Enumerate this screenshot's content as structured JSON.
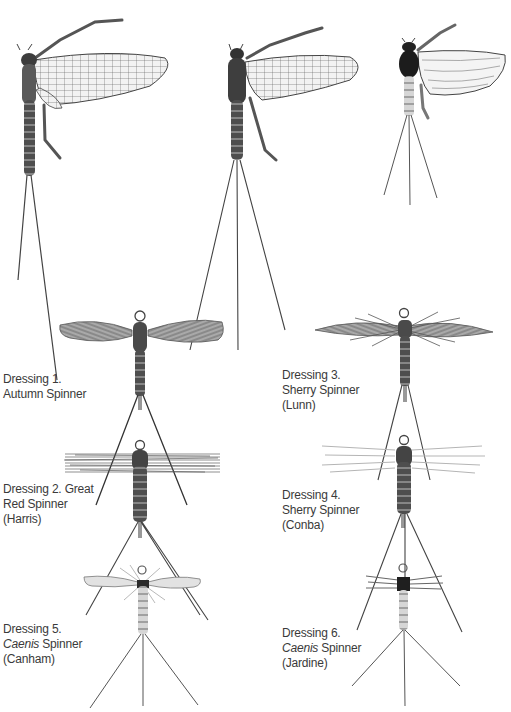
{
  "plate": {
    "background": "#ffffff",
    "ink_color": "#3a3a3a",
    "natural_insects": [
      {
        "name": "spinner-natural-large",
        "body_color": "#5a5a5a"
      },
      {
        "name": "spinner-natural-medium",
        "body_color": "#4a4a4a"
      },
      {
        "name": "caenis-natural",
        "body_color": "#2a2a2a"
      }
    ],
    "dressings": [
      {
        "number": "1",
        "line1": "Dressing 1.",
        "line2_italic": "",
        "line2": "Autumn Spinner",
        "line3": ""
      },
      {
        "number": "2",
        "line1": "Dressing 2. Great",
        "line2_italic": "",
        "line2": "Red Spinner",
        "line3": "(Harris)"
      },
      {
        "number": "3",
        "line1": "Dressing 3.",
        "line2_italic": "",
        "line2": "Sherry Spinner",
        "line3": "(Lunn)"
      },
      {
        "number": "4",
        "line1": "Dressing 4.",
        "line2_italic": "",
        "line2": "Sherry Spinner",
        "line3": "(Conba)"
      },
      {
        "number": "5",
        "line1": "Dressing 5.",
        "line2_italic": "Caenis",
        "line2": " Spinner",
        "line3": "(Canham)"
      },
      {
        "number": "6",
        "line1": "Dressing 6.",
        "line2_italic": "Caenis",
        "line2": " Spinner",
        "line3": "(Jardine)"
      }
    ]
  }
}
